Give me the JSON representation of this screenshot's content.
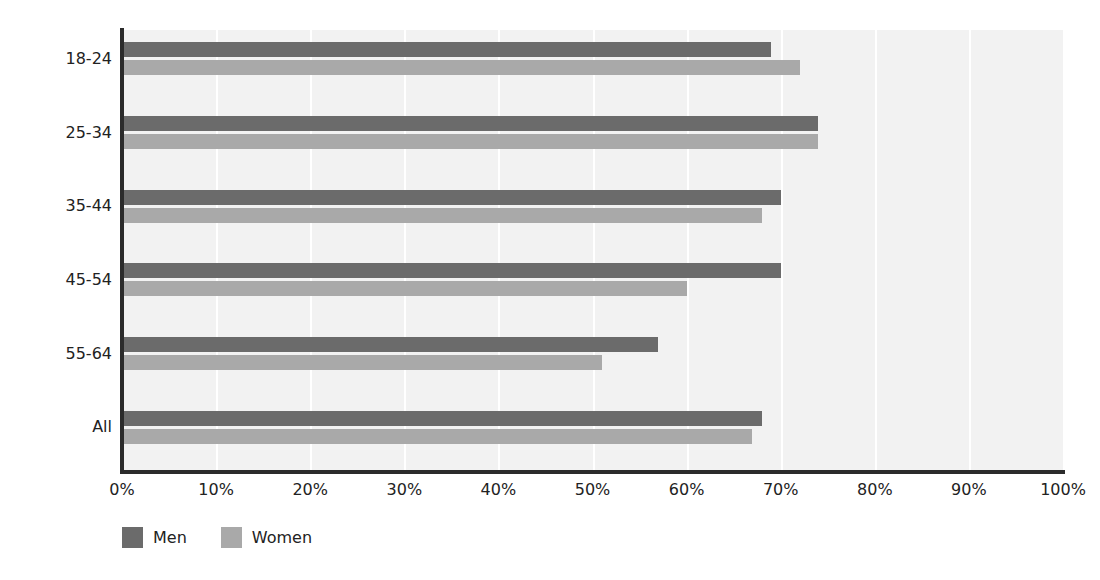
{
  "chart_data": {
    "type": "bar",
    "orientation": "horizontal",
    "title": "",
    "subtitle": "",
    "xlabel": "",
    "ylabel": "",
    "xlim": [
      0,
      100
    ],
    "xtick_labels": [
      "0%",
      "10%",
      "20%",
      "30%",
      "40%",
      "50%",
      "60%",
      "70%",
      "80%",
      "90%",
      "100%"
    ],
    "xtick_values": [
      0,
      10,
      20,
      30,
      40,
      50,
      60,
      70,
      80,
      90,
      100
    ],
    "grid": true,
    "grid_axis": "x",
    "legend_position": "bottom-left",
    "categories": [
      "18-24",
      "25-34",
      "35-44",
      "45-54",
      "55-64",
      "All"
    ],
    "series": [
      {
        "name": "Men",
        "color": "#6b6b6b",
        "values": [
          69,
          74,
          70,
          70,
          57,
          68
        ]
      },
      {
        "name": "Women",
        "color": "#a9a9a9",
        "values": [
          72,
          74,
          68,
          60,
          51,
          67
        ]
      }
    ],
    "colors": {
      "plot_background": "#f2f2f2",
      "page_background": "#ffffff",
      "axis": "#2b2b2b",
      "gridline": "#ffffff",
      "text": "#222222"
    }
  }
}
